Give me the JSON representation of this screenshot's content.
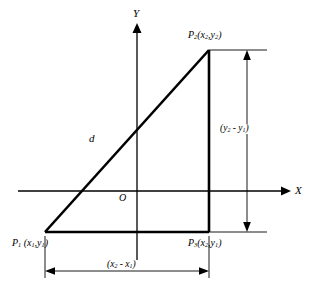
{
  "figure": {
    "type": "geometry-diagram",
    "background_color": "#ffffff",
    "line_color": "#000000",
    "dimension_line_color": "#000000"
  },
  "axes": {
    "x_label": "X",
    "y_label": "Y",
    "origin_label": "O"
  },
  "points": [
    {
      "id": "p1",
      "name": "P",
      "index": "1",
      "coord_x": "x",
      "coord_x_sub": "1",
      "coord_y": "y",
      "coord_y_sub": "1",
      "position": "bottom-left vertex"
    },
    {
      "id": "p2",
      "name": "P",
      "index": "2",
      "coord_x": "x",
      "coord_x_sub": "2",
      "coord_y": "y",
      "coord_y_sub": "2",
      "position": "top-right vertex"
    },
    {
      "id": "p3",
      "name": "P",
      "index": "3",
      "coord_x": "x",
      "coord_x_sub": "2",
      "coord_y": "y",
      "coord_y_sub": "1",
      "position": "bottom-right vertex (right angle)"
    }
  ],
  "segments": {
    "hypotenuse_label": "d",
    "vertical_dimension": {
      "open_paren": "(",
      "term1": "y",
      "term1_sub": "2",
      "minus": " - ",
      "term2": "y",
      "term2_sub": "1",
      "close_paren": ")"
    },
    "horizontal_dimension": {
      "open_paren": "(",
      "term1": "x",
      "term1_sub": "2",
      "minus": " - ",
      "term2": "x",
      "term2_sub": "1",
      "close_paren": ")"
    }
  }
}
